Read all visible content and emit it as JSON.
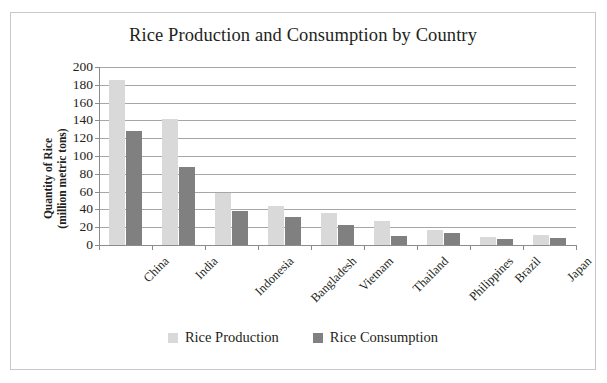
{
  "chart_data": {
    "type": "bar",
    "title": "Rice Production and Consumption by Country",
    "xlabel": "",
    "ylabel": "Quantity of Rice (million metric tons)",
    "ylabel_line1": "Quantity of Rice",
    "ylabel_line2": "(million metric tons)",
    "categories": [
      "China",
      "India",
      "Indonesia",
      "Bangladesh",
      "Vietnam",
      "Thailand",
      "Philippines",
      "Brazil",
      "Japan"
    ],
    "series": [
      {
        "name": "Rice Production",
        "color": "#d9d9d9",
        "values": [
          185,
          142,
          58,
          44,
          36,
          27,
          17,
          9,
          11
        ]
      },
      {
        "name": "Rice Consumption",
        "color": "#808080",
        "values": [
          128,
          88,
          38,
          31,
          22,
          10,
          13,
          7,
          8
        ]
      }
    ],
    "ylim": [
      0,
      200
    ],
    "ytick_step": 20,
    "yticks": [
      0,
      20,
      40,
      60,
      80,
      100,
      120,
      140,
      160,
      180,
      200
    ],
    "ytick_labels": [
      "0",
      "20",
      "40",
      "60",
      "80",
      "100",
      "120",
      "140",
      "160",
      "180",
      "200"
    ],
    "grid": true,
    "grid_axis": "y",
    "legend_position": "bottom",
    "category_label_rotation": -45,
    "plot_background": "#ffffff",
    "gridline_color": "#a6a6a6",
    "axis_color": "#8c8c8c",
    "border_color": "#c8c8c8",
    "text_color": "#231f20"
  }
}
